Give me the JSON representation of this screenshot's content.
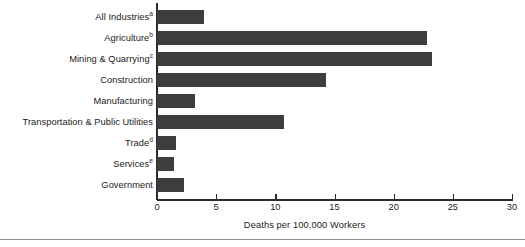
{
  "chart_data": {
    "type": "bar",
    "orientation": "horizontal",
    "title": "",
    "xlabel": "Deaths per 100,000 Workers",
    "ylabel": "",
    "xlim": [
      0,
      30
    ],
    "xticks": [
      0,
      5,
      10,
      15,
      20,
      25,
      30
    ],
    "xtick_labels": [
      "0",
      "5",
      "10",
      "15",
      "20",
      "25",
      "30"
    ],
    "grid": false,
    "legend": null,
    "bar_color": "#3d3d3d",
    "axis_color": "#2b2b2b",
    "categories": [
      "All Industries",
      "Agriculture",
      "Mining & Quarrying",
      "Construction",
      "Manufacturing",
      "Transportation & Public Utilities",
      "Trade",
      "Services",
      "Government"
    ],
    "category_footnotes": [
      "a",
      "b",
      "c",
      "",
      "",
      "",
      "d",
      "e",
      ""
    ],
    "values": [
      4.0,
      22.8,
      23.2,
      14.3,
      3.2,
      10.7,
      1.6,
      1.4,
      2.3
    ]
  }
}
